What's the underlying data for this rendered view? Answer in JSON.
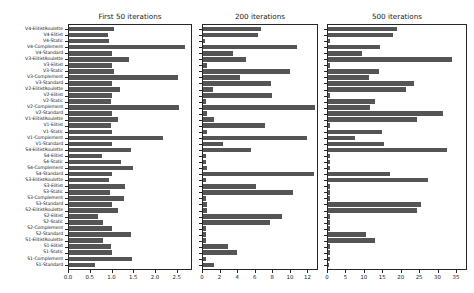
{
  "chart_data": {
    "type": "bar",
    "orientation": "horizontal",
    "title": "",
    "xlabel": "",
    "ylabel": "",
    "grid": false,
    "legend": null,
    "bar_color": "#555555",
    "categories": [
      "V4-ElitistRoulette",
      "V4-Elitist",
      "V4-Static",
      "V4-Complement",
      "V4-Standard",
      "V3-ElitistRoulette",
      "V3-Elitist",
      "V3-Static",
      "V3-Complement",
      "V3-Standard",
      "V2-ElitistRoulette",
      "V2-Elitist",
      "V2-Static",
      "V2-Complement",
      "V2-Standard",
      "V1-ElitistRoulette",
      "V1-Elitist",
      "V1-Static",
      "V1-Complement",
      "V1-Standard",
      "S4-ElitistRoulette",
      "S4-Elitist",
      "S4-Static",
      "S4-Complement",
      "S4-Standard",
      "S3-ElitistRoulette",
      "S3-Elitist",
      "S3-Static",
      "S3-Complement",
      "S3-Standard",
      "S2-ElitistRoulette",
      "S2-Elitist",
      "S2-Static",
      "S2-Complement",
      "S2-Standard",
      "S1-ElitistRoulette",
      "S1-Elitist",
      "S1-Static",
      "S1-Complement",
      "S1-Standard"
    ],
    "panels": [
      {
        "title": "First 50 iterations",
        "xlim": [
          0,
          2.85
        ],
        "xticks": [
          0,
          0.5,
          1.0,
          1.5,
          2.0,
          2.5
        ],
        "xticklabels": [
          "0.0",
          "0.5",
          "1.0",
          "1.5",
          "2.0",
          "2.5"
        ],
        "values": [
          1.05,
          0.92,
          0.95,
          2.68,
          1.0,
          1.4,
          1.0,
          1.05,
          2.52,
          1.0,
          1.2,
          1.02,
          0.98,
          2.55,
          1.0,
          1.15,
          0.98,
          1.0,
          2.18,
          1.0,
          1.45,
          0.78,
          1.22,
          1.5,
          1.0,
          0.95,
          1.3,
          0.97,
          1.28,
          1.02,
          1.15,
          0.7,
          0.8,
          1.02,
          1.45,
          0.8,
          0.98,
          1.02,
          1.48,
          0.62
        ]
      },
      {
        "title": "200 iterations",
        "xlim": [
          0,
          13.2
        ],
        "xticks": [
          0,
          2,
          4,
          6,
          8,
          10,
          12
        ],
        "xticklabels": [
          "0",
          "2",
          "4",
          "6",
          "8",
          "10",
          "12"
        ],
        "values": [
          6.7,
          6.4,
          0.35,
          10.8,
          3.5,
          5.0,
          0.55,
          10.0,
          4.3,
          7.9,
          1.3,
          8.0,
          0.45,
          12.9,
          0.55,
          1.4,
          7.2,
          0.55,
          11.9,
          2.4,
          5.6,
          0.4,
          0.5,
          0.55,
          12.8,
          0.5,
          6.2,
          10.3,
          0.5,
          0.55,
          0.55,
          9.1,
          7.7,
          0.5,
          0.5,
          0.5,
          3.0,
          4.0,
          0.5,
          1.4
        ]
      },
      {
        "title": "500 iterations",
        "xlim": [
          0,
          38.0
        ],
        "xticks": [
          0,
          5,
          10,
          15,
          20,
          25,
          30,
          35
        ],
        "xticklabels": [
          "0",
          "5",
          "10",
          "15",
          "20",
          "25",
          "30",
          "35"
        ],
        "values": [
          19.0,
          17.8,
          0.7,
          14.5,
          9.5,
          34.0,
          0.8,
          14.0,
          11.5,
          23.5,
          21.5,
          0.8,
          13.0,
          11.8,
          31.5,
          24.5,
          0.8,
          15.0,
          7.6,
          15.5,
          32.5,
          0.8,
          0.8,
          0.8,
          17.0,
          27.5,
          0.8,
          0.8,
          0.8,
          25.5,
          24.5,
          0.8,
          0.8,
          0.8,
          10.5,
          13.0,
          0.8,
          0.8,
          0.8,
          0.6
        ]
      }
    ]
  },
  "figure": {
    "background_color": "#ffffff",
    "axis_color": "#262626"
  }
}
